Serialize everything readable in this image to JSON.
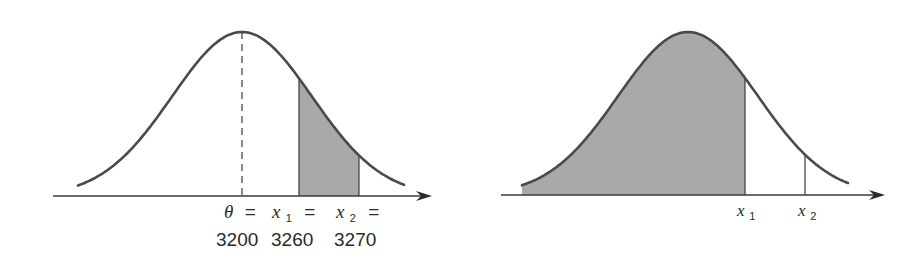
{
  "colors": {
    "curve": "#4a4a4a",
    "axis": "#3a3a3a",
    "shade": "#a9a9a9",
    "text": "#2a2a2a"
  },
  "left_plot": {
    "description": "Normal curve with shaded area between x1 and x2",
    "mean_px": 242,
    "sigma_px": 70,
    "peak_y": 32,
    "axis_y": 196,
    "axis_x_start": 53,
    "axis_x_end": 432,
    "curve_x_start": 78,
    "curve_x_end": 404,
    "shade_from": 299,
    "shade_to": 359,
    "labels": {
      "theta": "θ",
      "x1": "x",
      "x1_sub": "1",
      "x2": "x",
      "x2_sub": "2",
      "equals": "=",
      "theta_value": "3200",
      "x1_value": "3260",
      "x2_value": "3270"
    }
  },
  "right_plot": {
    "description": "Normal curve with shaded area left of x1, vertical line at x2",
    "mean_px": 688,
    "sigma_px": 70,
    "peak_y": 32,
    "axis_y": 195,
    "axis_x_start": 501,
    "axis_x_end": 885,
    "curve_x_start": 522,
    "curve_x_end": 848,
    "x1_px": 745,
    "x2_px": 805,
    "labels": {
      "x1": "x",
      "x1_sub": "1",
      "x2": "x",
      "x2_sub": "2"
    }
  }
}
